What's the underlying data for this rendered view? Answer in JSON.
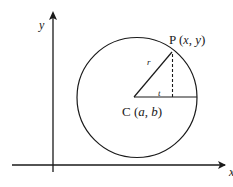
{
  "diagram": {
    "title": "",
    "axes": {
      "x_label": "x",
      "y_label": "y"
    },
    "circle": {
      "center_label": "C (a, b)",
      "center_label_parts": {
        "prefix": "C (",
        "a": "a",
        "sep": ", ",
        "b": "b",
        "suffix": ")"
      },
      "point_label": "P (x, y)",
      "point_label_parts": {
        "prefix": "P (",
        "x": "x",
        "sep": ", ",
        "y": "y",
        "suffix": ")"
      },
      "radius_label": "r",
      "angle_label": "t"
    },
    "colors": {
      "stroke": "#1a1a1a",
      "background": "#ffffff"
    }
  }
}
